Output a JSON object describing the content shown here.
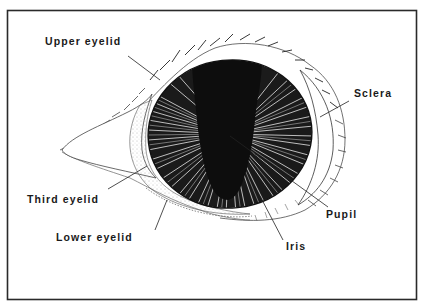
{
  "figure": {
    "colors": {
      "ink": "#111111",
      "paper": "#ffffff",
      "border": "#2a2a2a",
      "stipple": "#9a9a9a"
    }
  },
  "labels": {
    "upper_eyelid": "Upper eyelid",
    "sclera": "Sclera",
    "third_eyelid": "Third eyelid",
    "lower_eyelid": "Lower eyelid",
    "pupil": "Pupil",
    "iris": "Iris"
  }
}
